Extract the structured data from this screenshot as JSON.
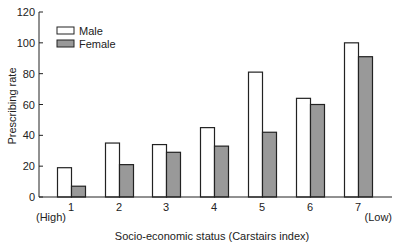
{
  "chart_data": {
    "type": "bar",
    "title": "",
    "xlabel": "Socio-economic status (Carstairs index)",
    "ylabel": "Prescribing rate",
    "x_end_labels": {
      "left": "(High)",
      "right": "(Low)"
    },
    "categories": [
      "1",
      "2",
      "3",
      "4",
      "5",
      "6",
      "7"
    ],
    "series": [
      {
        "name": "Male",
        "color": "#ffffff",
        "values": [
          19,
          35,
          34,
          45,
          81,
          64,
          100
        ]
      },
      {
        "name": "Female",
        "color": "#999999",
        "values": [
          7,
          21,
          29,
          33,
          42,
          60,
          91
        ]
      }
    ],
    "ylim": [
      0,
      120
    ],
    "yticks": [
      0,
      20,
      40,
      60,
      80,
      100,
      120
    ],
    "grid": false,
    "legend_position": "upper-left"
  }
}
